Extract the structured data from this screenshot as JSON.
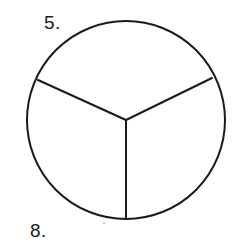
{
  "document": {
    "kind": "worksheet-figure",
    "background_color": "#ffffff",
    "ink_color": "#1a1a1a",
    "width": 243,
    "height": 248
  },
  "labels": {
    "top": {
      "text": "5.",
      "name": "question-number-5"
    },
    "bottom": {
      "text": "8.",
      "name": "question-number-8"
    }
  },
  "figure": {
    "name": "circle-divided-into-thirds",
    "shape": "circle",
    "center": {
      "x": 126,
      "y": 120
    },
    "radius": 99,
    "stroke_color": "#1a1a1a",
    "stroke_width": 2,
    "fill": "none",
    "sectors_count": 3,
    "radii": [
      {
        "name": "radius-down",
        "angle_deg": 90,
        "end": {
          "x": 126,
          "y": 219
        }
      },
      {
        "name": "radius-upper-left",
        "angle_deg": 205,
        "end": {
          "x": 38,
          "y": 80
        }
      },
      {
        "name": "radius-upper-right",
        "angle_deg": 335,
        "end": {
          "x": 212,
          "y": 78
        }
      }
    ]
  },
  "artifacts": [
    {
      "name": "scan-speck",
      "x": 103,
      "y": 222
    }
  ]
}
